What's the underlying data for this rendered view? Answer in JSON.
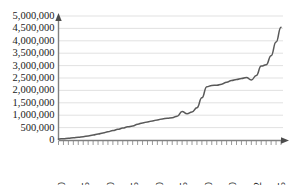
{
  "chart_data": {
    "type": "line",
    "title": "",
    "subtitle": "",
    "xlabel": "",
    "ylabel": "",
    "grid": true,
    "legend": null,
    "legend_position": "none",
    "line_color": "#595959",
    "gridline_color": "#d9d9d9",
    "axis_color": "#808080",
    "ylim": [
      0,
      5000000
    ],
    "ytick_values": [
      0,
      500000,
      1000000,
      1500000,
      2000000,
      2500000,
      3000000,
      3500000,
      4000000,
      4500000,
      5000000
    ],
    "ytick_labels": [
      "0",
      "500,000",
      "1,000,000",
      "1,500,000",
      "2,000,000",
      "2,500,000",
      "3,000,000",
      "3,500,000",
      "4,000,000",
      "4,500,000",
      "5,000,000"
    ],
    "xtick_labels": [
      "1970",
      "1975",
      "1980",
      "1985",
      "1990",
      "1995",
      "2000",
      "2010",
      "2012",
      "2015"
    ],
    "xtick_positions": [
      0,
      5,
      10,
      15,
      20,
      25,
      30,
      35,
      40,
      45
    ],
    "x_axis_note": "Tick labels are spaced evenly in pixels although the year gaps after 2000 are unequal (2000, 2010, 2012, 2015).",
    "x": [
      0,
      1,
      2,
      3,
      4,
      5,
      6,
      7,
      8,
      9,
      10,
      11,
      12,
      13,
      14,
      15,
      16,
      17,
      18,
      19,
      20,
      21,
      22,
      23,
      24,
      25,
      26,
      27,
      28,
      29,
      30,
      31,
      32,
      33,
      34,
      35,
      36,
      37,
      38,
      39,
      40,
      41,
      42,
      43,
      44,
      45
    ],
    "x_labels_full": [
      "1970",
      "1971",
      "1972",
      "1973",
      "1974",
      "1975",
      "1976",
      "1977",
      "1978",
      "1979",
      "1980",
      "1981",
      "1982",
      "1983",
      "1984",
      "1985",
      "1986",
      "1987",
      "1988",
      "1989",
      "1990",
      "1991",
      "1992",
      "1993",
      "1994",
      "1995",
      "1996",
      "1997",
      "1998",
      "1999",
      "2000",
      "2001",
      "2002",
      "2003",
      "2004",
      "2005",
      "2006",
      "2007",
      "2008",
      "2009",
      "2010",
      "2011",
      "2012",
      "2013",
      "2014",
      "2015"
    ],
    "values": [
      40000,
      55000,
      70000,
      90000,
      110000,
      135000,
      165000,
      200000,
      240000,
      285000,
      330000,
      380000,
      430000,
      480000,
      530000,
      560000,
      640000,
      690000,
      730000,
      770000,
      810000,
      850000,
      880000,
      900000,
      960000,
      1150000,
      1060000,
      1130000,
      1300000,
      1700000,
      2150000,
      2200000,
      2210000,
      2250000,
      2330000,
      2400000,
      2440000,
      2480000,
      2520000,
      2420000,
      2600000,
      2980000,
      3030000,
      3400000,
      3950000,
      4550000
    ],
    "annotations": []
  }
}
